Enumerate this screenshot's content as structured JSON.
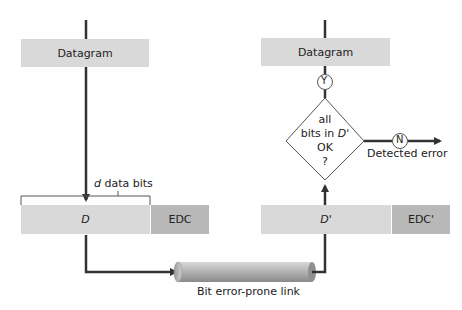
{
  "sender": {
    "datagram_label": "Datagram",
    "data_bits_label_var": "d",
    "data_bits_label_rest": " data bits",
    "data_field_label": "D",
    "edc_label": "EDC"
  },
  "link": {
    "label": "Bit error-prone link"
  },
  "receiver": {
    "datagram_label": "Datagram",
    "data_field_label": "D'",
    "edc_label": "EDC'",
    "decision": {
      "line1": "all",
      "line2_prefix": "bits in ",
      "line2_var": "D'",
      "line3": "OK",
      "line4": "?"
    },
    "yes_label": "Y",
    "no_label": "N",
    "error_label": "Detected error"
  },
  "colors": {
    "light_box": "#d9d9d9",
    "dark_box": "#b8b8b8",
    "line": "#333333"
  }
}
